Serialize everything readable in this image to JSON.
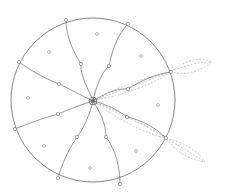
{
  "diagram": {
    "colors": {
      "outline": "#6b6b6b",
      "leaf_dashed": "#b8b8b8",
      "background": "#ffffff"
    },
    "circle": {
      "cx": 93,
      "cy": 100,
      "r": 82
    },
    "center": {
      "x": 93,
      "y": 101
    },
    "rim_points": [
      {
        "x": 66,
        "y": 20
      },
      {
        "x": 128,
        "y": 24
      },
      {
        "x": 171,
        "y": 72
      },
      {
        "x": 166,
        "y": 138
      },
      {
        "x": 120,
        "y": 184
      },
      {
        "x": 58,
        "y": 178
      },
      {
        "x": 15,
        "y": 129
      },
      {
        "x": 19,
        "y": 62
      }
    ],
    "mid_points": [
      {
        "x": 81,
        "y": 64
      },
      {
        "x": 109,
        "y": 66
      },
      {
        "x": 128,
        "y": 89
      },
      {
        "x": 127,
        "y": 117
      },
      {
        "x": 106,
        "y": 137
      },
      {
        "x": 77,
        "y": 137
      },
      {
        "x": 58,
        "y": 114
      },
      {
        "x": 59,
        "y": 84
      }
    ],
    "sector_dots": [
      {
        "x": 97,
        "y": 34
      },
      {
        "x": 141,
        "y": 56
      },
      {
        "x": 158,
        "y": 105
      },
      {
        "x": 136,
        "y": 151
      },
      {
        "x": 90,
        "y": 168
      },
      {
        "x": 44,
        "y": 146
      },
      {
        "x": 28,
        "y": 98
      },
      {
        "x": 49,
        "y": 52
      }
    ],
    "leaves": [
      {
        "from": "upper-right-rim",
        "tip": {
          "x": 212,
          "y": 62
        }
      },
      {
        "from": "center-upper",
        "tip": {
          "x": 171,
          "y": 72
        }
      },
      {
        "from": "center-lower",
        "tip": {
          "x": 166,
          "y": 138
        }
      },
      {
        "from": "lower-right-rim",
        "tip": {
          "x": 205,
          "y": 162
        }
      }
    ]
  }
}
